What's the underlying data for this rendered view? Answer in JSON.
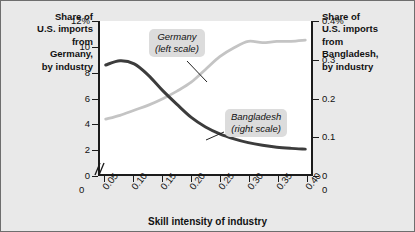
{
  "figure": {
    "background_color": "#e9e9e9",
    "plot_background_color": "#ffffff",
    "axis_color": "#1b1b1b"
  },
  "titles": {
    "left": "Share of\nU.S. imports\nfrom\nGermany,\nby industry",
    "right": "Share of\nU.S. imports\nfrom\nBangladesh,\nby industry"
  },
  "axes": {
    "x_title": "Skill intensity of industry",
    "x_ticks": [
      "0.05",
      "0.10",
      "0.15",
      "0.20",
      "0.25",
      "0.30",
      "0.35",
      "0.40"
    ],
    "x_zero_left": "0",
    "x_zero_right": "0",
    "y_left_ticks": [
      "12%",
      "10",
      "8",
      "6",
      "4",
      "2",
      "0"
    ],
    "y_right_ticks": [
      "0.4%",
      "0.3",
      "0.2",
      "0.1",
      "0"
    ],
    "axis_break_marker": "//"
  },
  "callouts": {
    "germany": "Germany\n(left scale)",
    "bangladesh": "Bangladesh\n(right scale)"
  },
  "chart_data": {
    "type": "line",
    "title": "",
    "subtitle": "",
    "xlabel": "Skill intensity of industry",
    "ylabel": "Share of U.S. imports from Germany, by industry",
    "y2label": "Share of U.S. imports from Bangladesh, by industry",
    "xlim": [
      0.04,
      0.41
    ],
    "ylim": [
      0,
      12
    ],
    "y2lim": [
      0,
      0.4
    ],
    "grid": false,
    "legend": "inline-callouts",
    "x": [
      0.05,
      0.075,
      0.1,
      0.125,
      0.15,
      0.175,
      0.2,
      0.225,
      0.25,
      0.275,
      0.3,
      0.325,
      0.35,
      0.375,
      0.4
    ],
    "series": [
      {
        "name": "Germany (left scale)",
        "axis": "left",
        "units": "%",
        "color": "#c4c4c4",
        "values": [
          4.3,
          4.6,
          5.0,
          5.4,
          5.9,
          6.5,
          7.2,
          8.2,
          9.2,
          9.9,
          10.4,
          10.3,
          10.4,
          10.4,
          10.5
        ]
      },
      {
        "name": "Bangladesh (right scale)",
        "axis": "right",
        "units": "%",
        "color": "#3c3c3c",
        "values": [
          0.285,
          0.296,
          0.288,
          0.258,
          0.218,
          0.182,
          0.148,
          0.123,
          0.105,
          0.092,
          0.082,
          0.075,
          0.07,
          0.067,
          0.065
        ]
      }
    ],
    "annotations": [
      {
        "text": "Germany (left scale)",
        "points_to_series": "Germany (left scale)"
      },
      {
        "text": "Bangladesh (right scale)",
        "points_to_series": "Bangladesh (right scale)"
      }
    ]
  }
}
